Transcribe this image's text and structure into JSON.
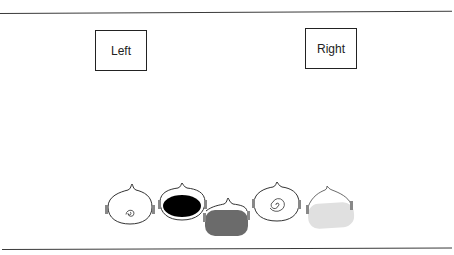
{
  "diagram": {
    "labels": {
      "left": "Left",
      "right": "Right"
    },
    "shapes": [
      {
        "id": "shape-1",
        "fill": "none",
        "pattern": "small-spiral",
        "color": "#ffffff"
      },
      {
        "id": "shape-2",
        "fill": "solid",
        "pattern": "none",
        "color": "#000000"
      },
      {
        "id": "shape-3",
        "fill": "solid",
        "pattern": "none",
        "color": "#6b6b6b"
      },
      {
        "id": "shape-4",
        "fill": "none",
        "pattern": "large-spiral",
        "color": "#ffffff"
      },
      {
        "id": "shape-5",
        "fill": "solid",
        "pattern": "none",
        "color": "#e0e0e0"
      }
    ],
    "colors": {
      "line": "#3a3a3a",
      "outline": "#333333"
    }
  }
}
